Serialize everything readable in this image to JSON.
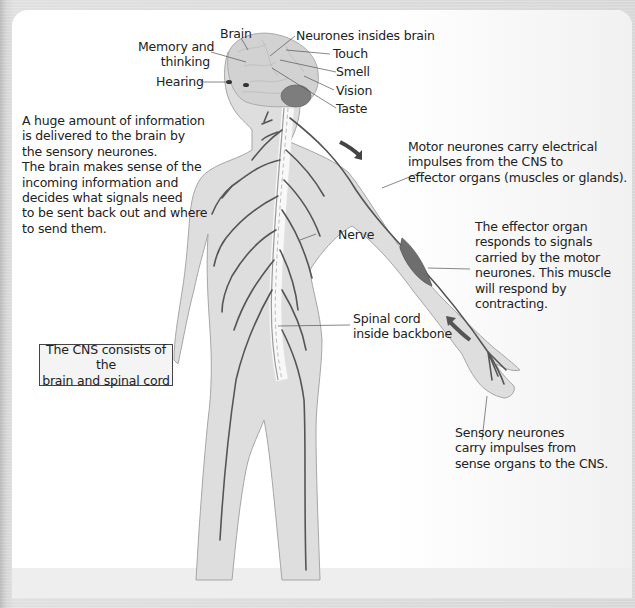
{
  "diagram": {
    "colors": {
      "body_fill": "#dcdcdc",
      "body_outline": "#a8a8a8",
      "nerve": "#555555",
      "muscle": "#6e6e6e",
      "brain": "#cfcfcf",
      "cerebellum": "#7a7a7a",
      "box_border": "#444444"
    },
    "brain_labels": {
      "brain": "Brain",
      "memory_line1": "Memory and",
      "memory_line2": "thinking",
      "hearing": "Hearing",
      "neurones_inside": "Neurones insides brain",
      "touch": "Touch",
      "smell": "Smell",
      "vision": "Vision",
      "taste": "Taste"
    },
    "body_labels": {
      "nerve": "Nerve",
      "spinal_cord_line1": "Spinal cord",
      "spinal_cord_line2": "inside backbone"
    },
    "paragraphs": {
      "information": "A huge amount of information\nis delivered to the brain by\nthe sensory neurones.\nThe brain makes sense of the\nincoming information and\ndecides what signals need\nto be sent back out and where\nto send them.",
      "motor": "Motor neurones carry electrical\nimpulses from the CNS to\neffector organs (muscles or glands).",
      "effector": "The effector organ\nresponds to signals\ncarried by the motor\nneurones. This muscle\nwill respond by\ncontracting.",
      "sensory": "Sensory neurones\ncarry impulses from\nsense organs to the CNS."
    },
    "cns_box": {
      "line1": "The CNS consists of the",
      "line2": "brain and spinal cord"
    },
    "icons": {
      "motor_arrow": "arrow-down-right",
      "sensory_arrow": "arrow-up-left"
    }
  }
}
